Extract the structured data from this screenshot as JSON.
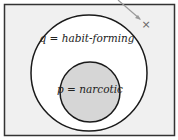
{
  "diagram": {
    "type": "euler",
    "outer_set": {
      "label": "q = habit-forming",
      "fill": "#ffffff",
      "stroke": "#1a1a1a"
    },
    "inner_set": {
      "label": "p = narcotic",
      "fill": "#d6d6d6",
      "stroke": "#1a1a1a"
    },
    "universe": {
      "fill": "#f0f0f0",
      "stroke": "#333333"
    },
    "marker": {
      "symbol": "×",
      "color": "#666666",
      "arrow_color": "#9a9a9a"
    }
  }
}
